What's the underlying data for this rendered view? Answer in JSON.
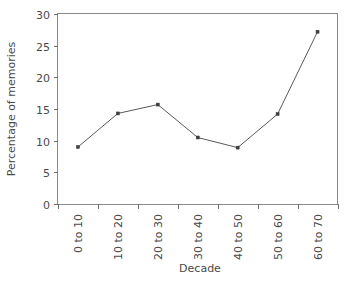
{
  "chart_data": {
    "type": "line",
    "title": "",
    "xlabel": "Decade",
    "ylabel": "Percentage of memories",
    "categories": [
      "0 to 10",
      "10 to 20",
      "20 to 30",
      "30 to 40",
      "40 to 50",
      "50 to 60",
      "60 to 70"
    ],
    "values": [
      9.0,
      14.3,
      15.7,
      10.5,
      8.9,
      14.2,
      27.2
    ],
    "ylim": [
      0,
      30
    ],
    "yticks": [
      0,
      5,
      10,
      15,
      20,
      25,
      30
    ],
    "ytick_labels": [
      "0",
      "5",
      "10",
      "15",
      "20",
      "25",
      "30"
    ],
    "grid": false,
    "legend": "none",
    "marker": "square",
    "xtick_label_rotation": 90,
    "line_color": "#5a5a5a",
    "marker_color": "#3d3d3d",
    "axis_color": "#8a8a8a",
    "text_color": "#4a4a4a",
    "background_color": "#ffffff"
  }
}
